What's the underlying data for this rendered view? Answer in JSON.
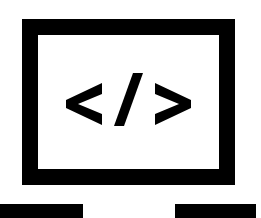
{
  "icon": {
    "name": "web-development-laptop-code",
    "label": "Code on laptop screen",
    "glyphs": [
      "<",
      "/",
      ">"
    ],
    "colors": {
      "stroke": "#000000",
      "background": "#ffffff"
    },
    "screen_frame": {
      "x": 22,
      "y": 19,
      "width": 213,
      "height": 166,
      "stroke_width": 16
    },
    "base_bars": [
      {
        "x": 0,
        "y": 204,
        "width": 83,
        "height": 14
      },
      {
        "x": 175,
        "y": 204,
        "width": 81,
        "height": 14
      }
    ]
  }
}
